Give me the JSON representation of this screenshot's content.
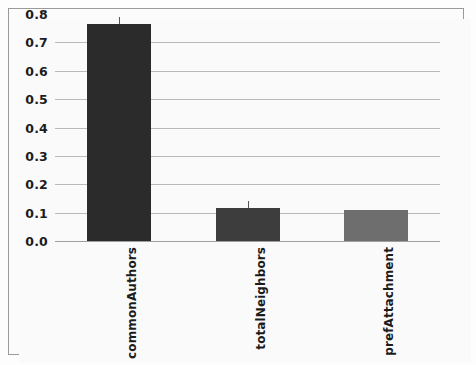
{
  "chart_data": {
    "type": "bar",
    "title": "",
    "subtitle": "",
    "xlabel": "",
    "ylabel": "",
    "categories": [
      "commonAuthors",
      "totalNeighbors",
      "prefAttachment"
    ],
    "values": [
      0.765,
      0.115,
      0.11
    ],
    "series": [
      {
        "name": "importance",
        "values": [
          0.765,
          0.115,
          0.11
        ]
      }
    ],
    "bar_colors": [
      "#2b2b2b",
      "#3d3d3d",
      "#6e6e6e"
    ],
    "ylim": [
      0.0,
      0.8
    ],
    "yticks": [
      0.0,
      0.1,
      0.2,
      0.3,
      0.4,
      0.5,
      0.6,
      0.7,
      0.8
    ],
    "ytick_labels": [
      "0.0",
      "0.1",
      "0.2",
      "0.3",
      "0.4",
      "0.5",
      "0.6",
      "0.7",
      "0.8"
    ],
    "grid": true,
    "grid_axis": "y",
    "grid_color": "#b9b9b9",
    "legend": false,
    "legend_position": "none",
    "error_bars": true,
    "background_color": "#fafafa",
    "frame_color": "#9a9a9a",
    "tick_label_color": "#1c1c1c",
    "xtick_rotation": 90
  }
}
